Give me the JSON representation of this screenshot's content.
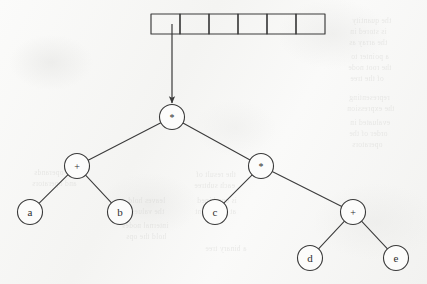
{
  "figure": {
    "expression": "(a + b) * (c * (d + e))",
    "paper_color": "#f7f7f6",
    "ink_color": "#3a3a3a"
  },
  "array": {
    "name": "cell-array",
    "cell_count": 6,
    "x": 151,
    "y": 14,
    "cell_width": 29,
    "height": 20,
    "cells": [
      {
        "index": 0,
        "value": ""
      },
      {
        "index": 1,
        "value": ""
      },
      {
        "index": 2,
        "value": ""
      },
      {
        "index": 3,
        "value": ""
      },
      {
        "index": 4,
        "value": ""
      },
      {
        "index": 5,
        "value": ""
      }
    ]
  },
  "pointer": {
    "name": "pointer-arrow",
    "from": {
      "x": 172,
      "y": 24
    },
    "to": {
      "x": 172,
      "y": 103
    },
    "label": ""
  },
  "tree": {
    "radius": 12.5,
    "nodes": [
      {
        "id": "root",
        "label": "*",
        "x": 172,
        "y": 117,
        "kind": "operator"
      },
      {
        "id": "n-plus-ab",
        "label": "+",
        "x": 77,
        "y": 166,
        "kind": "operator"
      },
      {
        "id": "n-mult-r",
        "label": "*",
        "x": 261,
        "y": 166,
        "kind": "operator"
      },
      {
        "id": "leaf-a",
        "label": "a",
        "x": 30,
        "y": 212,
        "kind": "operand"
      },
      {
        "id": "leaf-b",
        "label": "b",
        "x": 120,
        "y": 212,
        "kind": "operand"
      },
      {
        "id": "leaf-c",
        "label": "c",
        "x": 215,
        "y": 212,
        "kind": "operand"
      },
      {
        "id": "n-plus-de",
        "label": "+",
        "x": 353,
        "y": 212,
        "kind": "operator"
      },
      {
        "id": "leaf-d",
        "label": "d",
        "x": 310,
        "y": 258,
        "kind": "operand"
      },
      {
        "id": "leaf-e",
        "label": "e",
        "x": 396,
        "y": 258,
        "kind": "operand"
      }
    ],
    "edges": [
      {
        "from": "root",
        "to": "n-plus-ab"
      },
      {
        "from": "root",
        "to": "n-mult-r"
      },
      {
        "from": "n-plus-ab",
        "to": "leaf-a"
      },
      {
        "from": "n-plus-ab",
        "to": "leaf-b"
      },
      {
        "from": "n-mult-r",
        "to": "leaf-c"
      },
      {
        "from": "n-mult-r",
        "to": "n-plus-de"
      },
      {
        "from": "n-plus-de",
        "to": "leaf-d"
      },
      {
        "from": "n-plus-de",
        "to": "leaf-e"
      }
    ]
  },
  "background_showthrough": [
    {
      "text": "the quantity",
      "x": 352,
      "y": 16
    },
    {
      "text": "is stored in",
      "x": 350,
      "y": 27
    },
    {
      "text": "the array as",
      "x": 349,
      "y": 38
    },
    {
      "text": "a pointer to",
      "x": 351,
      "y": 52
    },
    {
      "text": "the root node",
      "x": 348,
      "y": 63
    },
    {
      "text": "of the tree",
      "x": 350,
      "y": 74
    },
    {
      "text": "representing",
      "x": 349,
      "y": 93
    },
    {
      "text": "the expression",
      "x": 347,
      "y": 104
    },
    {
      "text": "evaluated in",
      "x": 350,
      "y": 118
    },
    {
      "text": "order of the",
      "x": 349,
      "y": 129
    },
    {
      "text": "operators",
      "x": 352,
      "y": 140
    },
    {
      "text": "the result of",
      "x": 196,
      "y": 170
    },
    {
      "text": "each subtree",
      "x": 194,
      "y": 181
    },
    {
      "text": "is combined",
      "x": 197,
      "y": 196
    },
    {
      "text": "at the parent",
      "x": 195,
      "y": 207
    },
    {
      "text": "a binary tree",
      "x": 205,
      "y": 244
    },
    {
      "text": "of operands",
      "x": 34,
      "y": 168
    },
    {
      "text": "and operators",
      "x": 32,
      "y": 179
    },
    {
      "text": "leaves hold",
      "x": 128,
      "y": 196
    },
    {
      "text": "the values",
      "x": 131,
      "y": 207
    },
    {
      "text": "internal nodes",
      "x": 122,
      "y": 221
    },
    {
      "text": "hold the ops",
      "x": 126,
      "y": 232
    }
  ]
}
